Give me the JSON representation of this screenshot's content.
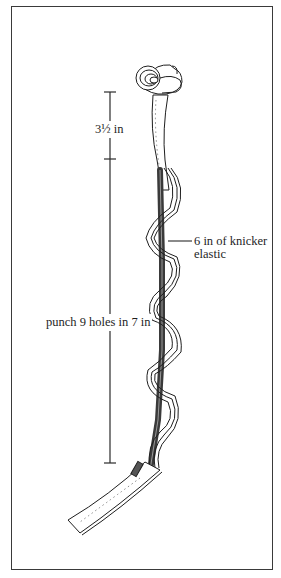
{
  "figure": {
    "colors": {
      "ink": "#1e1e1e",
      "frame": "#3a3a3a",
      "background": "#ffffff",
      "elastic": "#4a4a4a"
    }
  },
  "annotations": {
    "upper_dimension": "3½ in",
    "elastic_callout_line1": "6 in of knicker",
    "elastic_callout_line2": "elastic",
    "lower_dimension": "punch 9 holes in 7 in"
  },
  "dimension_lines": [
    {
      "name": "upper",
      "x": 110,
      "y_start": 92,
      "y_end": 159,
      "label": "3½ in"
    },
    {
      "name": "lower",
      "x": 110,
      "y_start": 159,
      "y_end": 463,
      "label": "punch 9 holes in 7 in"
    }
  ]
}
